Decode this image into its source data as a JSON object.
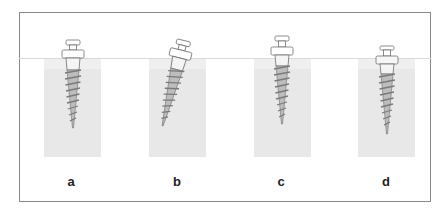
{
  "figure": {
    "panels": [
      {
        "id": "a",
        "label": "a",
        "tilt_deg": 0,
        "depth": "full"
      },
      {
        "id": "b",
        "label": "b",
        "tilt_deg": 14,
        "depth": "full"
      },
      {
        "id": "c",
        "label": "c",
        "tilt_deg": 0,
        "depth": "full"
      },
      {
        "id": "d",
        "label": "d",
        "tilt_deg": 0,
        "depth": "full"
      }
    ],
    "colors": {
      "frame": "#8a8a8a",
      "bone": "#e8e8e8",
      "surface_line": "#d6dadc",
      "screw_outline": "#6f6f6f",
      "screw_thread": "#8e8e8e"
    }
  }
}
